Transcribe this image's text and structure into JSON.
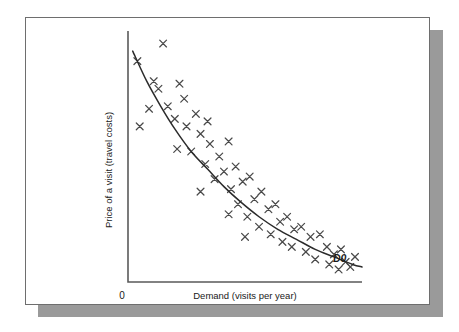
{
  "figure": {
    "panel_background": "#ffffff",
    "panel_border_color": "#6e6e6e",
    "shadow_color": "#9a9a9a",
    "origin_label": "0",
    "curve_label": "D0"
  },
  "chart_data": {
    "type": "scatter",
    "title": "",
    "subtitle": "",
    "xlabel": "Demand (visits per year)",
    "ylabel": "Price of a visit (travel costs)",
    "xlim": [
      0,
      100
    ],
    "ylim": [
      0,
      100
    ],
    "grid": false,
    "legend": null,
    "axis_ticks": false,
    "annotations": [
      {
        "text": "D0",
        "x": 96,
        "y": 8,
        "style": "italic",
        "describes": "demand-curve"
      },
      {
        "text": "0",
        "x": -3,
        "y": -6,
        "describes": "origin"
      }
    ],
    "series": [
      {
        "name": "Observed visits",
        "type": "scatter",
        "marker": "x",
        "color": "#4a4a4a",
        "points": [
          [
            4,
            88
          ],
          [
            15,
            95
          ],
          [
            11,
            80
          ],
          [
            5,
            62
          ],
          [
            13,
            77
          ],
          [
            22,
            79
          ],
          [
            9,
            69
          ],
          [
            17,
            70
          ],
          [
            20,
            65
          ],
          [
            24,
            73
          ],
          [
            25,
            62
          ],
          [
            29,
            67
          ],
          [
            31,
            59
          ],
          [
            34,
            64
          ],
          [
            21,
            53
          ],
          [
            27,
            52
          ],
          [
            35,
            55
          ],
          [
            33,
            47
          ],
          [
            39,
            50
          ],
          [
            43,
            56
          ],
          [
            37,
            41
          ],
          [
            41,
            44
          ],
          [
            46,
            46
          ],
          [
            31,
            36
          ],
          [
            44,
            37
          ],
          [
            49,
            40
          ],
          [
            52,
            42
          ],
          [
            47,
            31
          ],
          [
            54,
            33
          ],
          [
            57,
            36
          ],
          [
            43,
            27
          ],
          [
            51,
            26
          ],
          [
            60,
            29
          ],
          [
            63,
            31
          ],
          [
            56,
            22
          ],
          [
            50,
            18
          ],
          [
            65,
            24
          ],
          [
            68,
            26
          ],
          [
            61,
            19
          ],
          [
            66,
            16
          ],
          [
            71,
            21
          ],
          [
            74,
            22
          ],
          [
            70,
            14
          ],
          [
            78,
            18
          ],
          [
            82,
            19
          ],
          [
            76,
            12
          ],
          [
            85,
            14
          ],
          [
            80,
            9
          ],
          [
            88,
            11
          ],
          [
            91,
            13
          ],
          [
            86,
            7
          ],
          [
            93,
            8
          ],
          [
            97,
            10
          ],
          [
            90,
            5
          ],
          [
            95,
            6
          ]
        ]
      },
      {
        "name": "D0",
        "type": "line",
        "color": "#2b2b2b",
        "label": "D0",
        "points": [
          [
            2,
            92
          ],
          [
            8,
            80
          ],
          [
            14,
            70
          ],
          [
            20,
            61
          ],
          [
            27,
            52
          ],
          [
            34,
            45
          ],
          [
            41,
            38
          ],
          [
            48,
            32
          ],
          [
            56,
            26
          ],
          [
            64,
            21
          ],
          [
            72,
            17
          ],
          [
            80,
            13
          ],
          [
            88,
            10
          ],
          [
            96,
            7
          ],
          [
            100,
            6
          ]
        ]
      }
    ]
  }
}
